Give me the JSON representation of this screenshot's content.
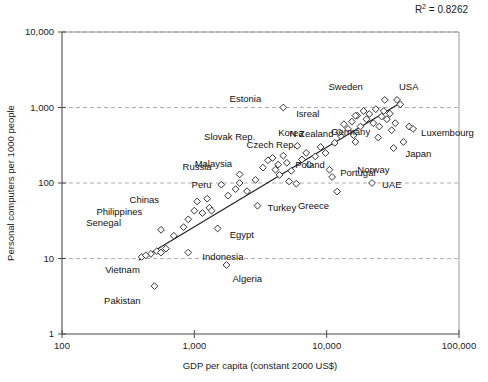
{
  "chart_data": {
    "type": "scatter",
    "title": "",
    "xlabel": "GDP per capita (constant 2000 US$)",
    "ylabel": "Personal computers per 1000 people",
    "xscale": "log",
    "yscale": "log",
    "xlim": [
      100,
      100000
    ],
    "ylim": [
      1,
      10000
    ],
    "xticks": [
      100,
      1000,
      10000,
      100000
    ],
    "xticklabels": [
      "100",
      "1,000",
      "10,000",
      "100,000"
    ],
    "yticks": [
      1,
      10,
      100,
      1000,
      10000
    ],
    "yticklabels": [
      "1",
      "10",
      "100",
      "1,000",
      "10,000"
    ],
    "grid": "horizontal-dashed",
    "legend": "none",
    "annotation": {
      "r2_prefix": "R",
      "r2_exponent": "2",
      "r2_value": "= 0.8262",
      "r2_full": "R2 = 0.8262"
    },
    "trendline": {
      "visible": true,
      "x_start": 380,
      "y_start": 9.5,
      "x_end": 36000,
      "y_end": 1150
    },
    "points": [
      {
        "label": "Estonia",
        "x": 4700,
        "y": 1000,
        "lx": -22,
        "ly": -9
      },
      {
        "label": "Isreal",
        "x": 16500,
        "y": 780,
        "lx": -36,
        "ly": -2
      },
      {
        "label": "Sweden",
        "x": 27500,
        "y": 1260,
        "lx": -22,
        "ly": -13
      },
      {
        "label": "USA",
        "x": 34000,
        "y": 1260,
        "lx": 2,
        "ly": -13
      },
      {
        "label": "Korea",
        "x": 12500,
        "y": 470,
        "lx": -36,
        "ly": 0
      },
      {
        "label": "N Zealand",
        "x": 16500,
        "y": 350,
        "lx": -22,
        "ly": -8
      },
      {
        "label": "Slovak Rep.",
        "x": 6000,
        "y": 310,
        "lx": -42,
        "ly": -9
      },
      {
        "label": "Czech Rep.",
        "x": 7000,
        "y": 250,
        "lx": -10,
        "ly": -8
      },
      {
        "label": "Germany",
        "x": 24500,
        "y": 400,
        "lx": -8,
        "ly": -6
      },
      {
        "label": "Luxembourg",
        "x": 45000,
        "y": 520,
        "lx": 8,
        "ly": 4
      },
      {
        "label": "Japan",
        "x": 38000,
        "y": 350,
        "lx": 2,
        "ly": 12
      },
      {
        "label": "Norway",
        "x": 32000,
        "y": 290,
        "lx": -4,
        "ly": 22
      },
      {
        "label": "Malaysia",
        "x": 4300,
        "y": 175,
        "lx": -46,
        "ly": -1
      },
      {
        "label": "Poland",
        "x": 5400,
        "y": 145,
        "lx": 4,
        "ly": -6
      },
      {
        "label": "Russia",
        "x": 2200,
        "y": 130,
        "lx": -28,
        "ly": -8
      },
      {
        "label": "Peru",
        "x": 2200,
        "y": 100,
        "lx": -28,
        "ly": 2
      },
      {
        "label": "Portugal",
        "x": 11000,
        "y": 120,
        "lx": 8,
        "ly": -4
      },
      {
        "label": "UAE",
        "x": 22000,
        "y": 100,
        "lx": 10,
        "ly": 2
      },
      {
        "label": "Greece",
        "x": 12000,
        "y": 77,
        "lx": -8,
        "ly": 14
      },
      {
        "label": "Chinas",
        "x": 1050,
        "y": 57,
        "lx": -38,
        "ly": -2
      },
      {
        "label": "Turkey",
        "x": 3000,
        "y": 50,
        "lx": 10,
        "ly": 2
      },
      {
        "label": "Philippines",
        "x": 1000,
        "y": 43,
        "lx": -52,
        "ly": 1
      },
      {
        "label": "Senegal",
        "x": 560,
        "y": 24,
        "lx": -40,
        "ly": -7
      },
      {
        "label": "Egypt",
        "x": 1500,
        "y": 25,
        "lx": 12,
        "ly": 6
      },
      {
        "label": "Indonesia",
        "x": 900,
        "y": 12,
        "lx": 14,
        "ly": 4
      },
      {
        "label": "Vietnam",
        "x": 430,
        "y": 11,
        "lx": -6,
        "ly": 14
      },
      {
        "label": "Algeria",
        "x": 1750,
        "y": 8.2,
        "lx": 6,
        "ly": 14
      },
      {
        "label": "Pakistan",
        "x": 500,
        "y": 4.3,
        "lx": -14,
        "ly": 14
      }
    ],
    "unlabeled_points": [
      {
        "x": 400,
        "y": 10.5
      },
      {
        "x": 470,
        "y": 11.5
      },
      {
        "x": 520,
        "y": 12.5
      },
      {
        "x": 560,
        "y": 12.0
      },
      {
        "x": 610,
        "y": 13.5
      },
      {
        "x": 700,
        "y": 20
      },
      {
        "x": 830,
        "y": 26
      },
      {
        "x": 900,
        "y": 33
      },
      {
        "x": 1150,
        "y": 40
      },
      {
        "x": 1250,
        "y": 62
      },
      {
        "x": 1300,
        "y": 47
      },
      {
        "x": 1350,
        "y": 43
      },
      {
        "x": 1600,
        "y": 95
      },
      {
        "x": 1800,
        "y": 68
      },
      {
        "x": 2050,
        "y": 83
      },
      {
        "x": 2500,
        "y": 78
      },
      {
        "x": 2900,
        "y": 110
      },
      {
        "x": 3300,
        "y": 160
      },
      {
        "x": 3600,
        "y": 200
      },
      {
        "x": 3900,
        "y": 215
      },
      {
        "x": 4100,
        "y": 150
      },
      {
        "x": 4400,
        "y": 128
      },
      {
        "x": 4700,
        "y": 230
      },
      {
        "x": 5000,
        "y": 185
      },
      {
        "x": 5200,
        "y": 105
      },
      {
        "x": 5900,
        "y": 98
      },
      {
        "x": 6500,
        "y": 205
      },
      {
        "x": 7400,
        "y": 175
      },
      {
        "x": 8200,
        "y": 225
      },
      {
        "x": 9000,
        "y": 300
      },
      {
        "x": 9800,
        "y": 250
      },
      {
        "x": 10500,
        "y": 150
      },
      {
        "x": 11500,
        "y": 340
      },
      {
        "x": 12800,
        "y": 420
      },
      {
        "x": 13500,
        "y": 600
      },
      {
        "x": 14500,
        "y": 520
      },
      {
        "x": 15500,
        "y": 650
      },
      {
        "x": 16000,
        "y": 430
      },
      {
        "x": 17000,
        "y": 780
      },
      {
        "x": 18000,
        "y": 560
      },
      {
        "x": 19000,
        "y": 900
      },
      {
        "x": 20000,
        "y": 700
      },
      {
        "x": 21000,
        "y": 820
      },
      {
        "x": 22500,
        "y": 620
      },
      {
        "x": 23500,
        "y": 950
      },
      {
        "x": 25000,
        "y": 560
      },
      {
        "x": 26000,
        "y": 760
      },
      {
        "x": 27000,
        "y": 900
      },
      {
        "x": 28500,
        "y": 700
      },
      {
        "x": 30000,
        "y": 830
      },
      {
        "x": 31000,
        "y": 500
      },
      {
        "x": 33000,
        "y": 620
      },
      {
        "x": 36000,
        "y": 1100
      },
      {
        "x": 42000,
        "y": 560
      }
    ]
  }
}
